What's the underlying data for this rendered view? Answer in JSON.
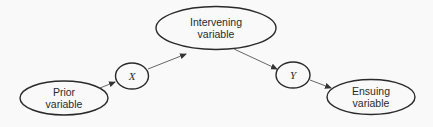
{
  "diagram": {
    "nodes": {
      "prior": {
        "line1": "Prior",
        "line2": "variable"
      },
      "x": {
        "label": "X"
      },
      "intervening": {
        "line1": "Intervening",
        "line2": "variable"
      },
      "y": {
        "label": "Y"
      },
      "ensuing": {
        "line1": "Ensuing",
        "line2": "variable"
      }
    },
    "edges": [
      {
        "from": "Prior variable",
        "to": "X"
      },
      {
        "from": "X",
        "to": "Intervening variable"
      },
      {
        "from": "Intervening variable",
        "to": "Y"
      },
      {
        "from": "Y",
        "to": "Ensuing variable"
      }
    ],
    "colors": {
      "stroke": "#2a2a2a",
      "arrow": "#555555",
      "background": "#f9f9f9"
    }
  }
}
